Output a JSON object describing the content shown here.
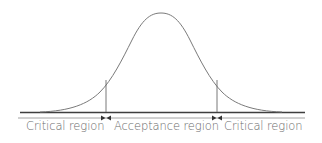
{
  "diagram": {
    "type": "normal-distribution",
    "colors": {
      "curve": "#7a7a7a",
      "baseline": "#4a4a4a",
      "axis": "#8a8a8a",
      "text": "#6a6a6a",
      "arrow": "#333333"
    },
    "regions": [
      {
        "label": "Critical region",
        "side": "left"
      },
      {
        "label": "Acceptance region",
        "side": "center"
      },
      {
        "label": "Critical region",
        "side": "right"
      }
    ],
    "critical_values": [
      "left-critical-value",
      "right-critical-value"
    ]
  }
}
